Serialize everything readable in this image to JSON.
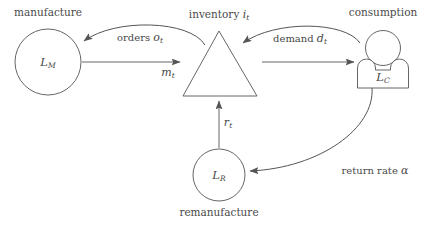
{
  "diagram": {
    "background_color": "#ffffff",
    "stroke_color": "#555555",
    "text_color": "#4a4a4a",
    "nodes": [
      {
        "id": "manufacture",
        "shape": "circle",
        "caption": "manufacture",
        "symbol": "L",
        "symbol_sub": "M",
        "cx": 48,
        "cy": 62,
        "r": 33
      },
      {
        "id": "inventory",
        "shape": "triangle",
        "caption": "inventory",
        "caption_symbol": "i",
        "caption_symbol_sub": "t",
        "apex_x": 219,
        "apex_y": 31,
        "base_y": 96,
        "base_left_x": 183,
        "base_right_x": 257
      },
      {
        "id": "consumption",
        "shape": "person",
        "caption": "consumption",
        "symbol": "L",
        "symbol_sub": "C",
        "cx": 383,
        "cy": 62
      },
      {
        "id": "remanufacture",
        "shape": "circle",
        "caption": "remanufacture",
        "symbol": "L",
        "symbol_sub": "R",
        "cx": 219,
        "cy": 175,
        "r": 26
      }
    ],
    "edges": [
      {
        "id": "orders",
        "from": "inventory",
        "to": "manufacture",
        "style": "curved",
        "label_text": "orders",
        "label_symbol": "o",
        "label_symbol_sub": "t",
        "label_x": 140,
        "label_y": 37
      },
      {
        "id": "manufacturing-flow",
        "from": "manufacture",
        "to": "inventory",
        "style": "straight",
        "label_text": "",
        "label_symbol": "m",
        "label_symbol_sub": "t",
        "label_x": 168,
        "label_y": 71
      },
      {
        "id": "demand",
        "from": "consumption",
        "to": "inventory",
        "style": "curved",
        "label_text": "demand",
        "label_symbol": "d",
        "label_symbol_sub": "t",
        "label_x": 300,
        "label_y": 38
      },
      {
        "id": "shipment-flow",
        "from": "inventory",
        "to": "consumption",
        "style": "straight",
        "label_text": "",
        "label_symbol": "",
        "label_symbol_sub": "",
        "label_x": 0,
        "label_y": 0
      },
      {
        "id": "returns",
        "from": "consumption",
        "to": "remanufacture",
        "style": "curved",
        "label_text": "return rate",
        "label_symbol": "α",
        "label_symbol_sub": "",
        "label_x": 375,
        "label_y": 170
      },
      {
        "id": "remanufacturing-flow",
        "from": "remanufacture",
        "to": "inventory",
        "style": "straight-vertical",
        "label_text": "",
        "label_symbol": "r",
        "label_symbol_sub": "t",
        "label_x": 227,
        "label_y": 122
      }
    ]
  }
}
